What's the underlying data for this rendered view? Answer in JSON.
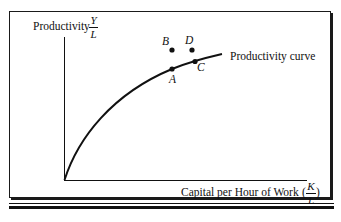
{
  "diagram": {
    "type": "productivity-curve",
    "y_axis": {
      "label": "Productivity",
      "fraction_numerator": "Y",
      "fraction_denominator": "L"
    },
    "x_axis": {
      "label": "Capital per Hour of Work",
      "open_paren": "(",
      "fraction_numerator": "K",
      "fraction_denominator": "L",
      "close_paren": ")"
    },
    "curve": {
      "label": "Productivity curve",
      "color": "#111111"
    },
    "points": [
      {
        "name": "A",
        "on_curve": true
      },
      {
        "name": "B",
        "on_curve": false
      },
      {
        "name": "C",
        "on_curve": true
      },
      {
        "name": "D",
        "on_curve": false
      }
    ]
  }
}
